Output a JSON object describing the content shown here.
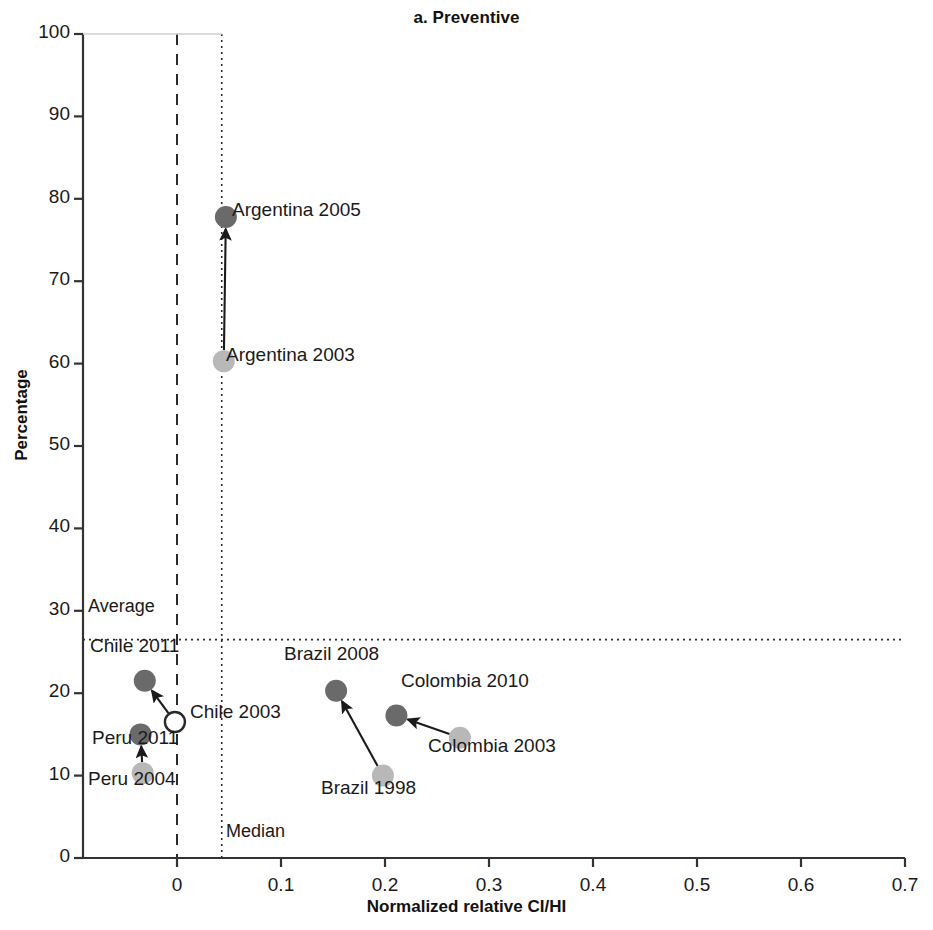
{
  "chart_data": {
    "type": "scatter",
    "title": "a. Preventive",
    "xlabel": "Normalized relative CI/HI",
    "ylabel": "Percentage",
    "xlim": [
      -0.07,
      0.7
    ],
    "ylim": [
      0,
      100
    ],
    "xticks": [
      "0",
      "0.1",
      "0.2",
      "0.3",
      "0.4",
      "0.5",
      "0.6",
      "0.7"
    ],
    "xtick_values": [
      0,
      0.1,
      0.2,
      0.3,
      0.4,
      0.5,
      0.6,
      0.7
    ],
    "yticks": [
      "0",
      "10",
      "20",
      "30",
      "40",
      "50",
      "60",
      "70",
      "80",
      "90",
      "100"
    ],
    "ytick_values": [
      0,
      10,
      20,
      30,
      40,
      50,
      60,
      70,
      80,
      90,
      100
    ],
    "grid": false,
    "legend_position": "none",
    "series": [
      {
        "name": "Earlier year",
        "marker": "filled-light-circle",
        "color": "#b8b8b8",
        "points": [
          {
            "label": "Argentina 2003",
            "x": 0.045,
            "y": 60.3
          },
          {
            "label": "Peru 2004",
            "x": -0.033,
            "y": 10.3
          },
          {
            "label": "Brazil 1998",
            "x": 0.198,
            "y": 10.0
          },
          {
            "label": "Colombia 2003",
            "x": 0.272,
            "y": 14.6
          }
        ]
      },
      {
        "name": "Later year",
        "marker": "filled-dark-circle",
        "color": "#6a6a6a",
        "points": [
          {
            "label": "Argentina 2005",
            "x": 0.047,
            "y": 77.8
          },
          {
            "label": "Chile 2011",
            "x": -0.031,
            "y": 21.5
          },
          {
            "label": "Peru 2011",
            "x": -0.035,
            "y": 15.0
          },
          {
            "label": "Brazil 2008",
            "x": 0.153,
            "y": 20.3
          },
          {
            "label": "Colombia 2010",
            "x": 0.211,
            "y": 17.3
          }
        ]
      },
      {
        "name": "Open marker",
        "marker": "open-circle",
        "color": "#ffffff",
        "points": [
          {
            "label": "Chile 2003",
            "x": -0.002,
            "y": 16.5
          }
        ]
      }
    ],
    "arrows": [
      {
        "from": "Argentina 2003",
        "to": "Argentina 2005"
      },
      {
        "from": "Chile 2003",
        "to": "Chile 2011"
      },
      {
        "from": "Peru 2004",
        "to": "Peru 2011"
      },
      {
        "from": "Brazil 1998",
        "to": "Brazil 2008"
      },
      {
        "from": "Colombia 2003",
        "to": "Colombia 2010"
      }
    ],
    "reference_lines": [
      {
        "name": "Average",
        "orientation": "horizontal",
        "value": 26.5,
        "style": "dotted",
        "label": "Average"
      },
      {
        "name": "Median",
        "orientation": "vertical",
        "value": 0.043,
        "style": "dotted",
        "label": "Median"
      },
      {
        "name": "zero-y",
        "orientation": "horizontal",
        "value": 0,
        "style": "dashed",
        "label": ""
      },
      {
        "name": "zero-x",
        "orientation": "vertical",
        "value": 0,
        "style": "dashed",
        "label": ""
      }
    ],
    "point_labels": [
      {
        "text": "Argentina 2005",
        "x": 232,
        "y": 199
      },
      {
        "text": "Argentina 2003",
        "x": 226,
        "y": 344
      },
      {
        "text": "Chile 2011",
        "x": 90,
        "y": 635
      },
      {
        "text": "Chile 2003",
        "x": 190,
        "y": 701
      },
      {
        "text": "Peru 2011",
        "x": 92,
        "y": 727
      },
      {
        "text": "Peru 2004",
        "x": 88,
        "y": 768
      },
      {
        "text": "Brazil 2008",
        "x": 284,
        "y": 643
      },
      {
        "text": "Brazil 1998",
        "x": 321,
        "y": 777
      },
      {
        "text": "Colombia 2010",
        "x": 401,
        "y": 670
      },
      {
        "text": "Colombia 2003",
        "x": 428,
        "y": 735
      }
    ],
    "reference_labels": [
      {
        "text": "Average",
        "x": 88,
        "y": 596
      },
      {
        "text": "Median",
        "x": 226,
        "y": 821
      }
    ]
  }
}
